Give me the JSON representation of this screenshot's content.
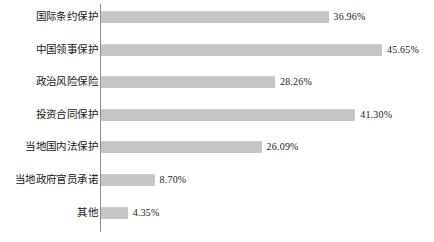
{
  "chart_data": {
    "type": "bar",
    "orientation": "horizontal",
    "title": "",
    "subtitle": "",
    "xlabel": "",
    "ylabel": "",
    "grid": false,
    "legend": null,
    "axis_color": "#8d8d8d",
    "bar_color": "#c6c6c6",
    "xlim": [
      0,
      50
    ],
    "categories": [
      "国际条约保护",
      "中国领事保护",
      "政治风险保险",
      "投资合同保护",
      "当地国内法保护",
      "当地政府官员承诺",
      "其他"
    ],
    "values": [
      36.96,
      45.65,
      28.26,
      41.3,
      26.09,
      8.7,
      4.35
    ],
    "value_labels": [
      "36.96%",
      "45.65%",
      "28.26%",
      "41.30%",
      "26.09%",
      "8.70%",
      "4.35%"
    ]
  },
  "rows": [
    {
      "label": "国际条约保护",
      "value": 36.96,
      "value_label": "36.96%"
    },
    {
      "label": "中国领事保护",
      "value": 45.65,
      "value_label": "45.65%"
    },
    {
      "label": "政治风险保险",
      "value": 28.26,
      "value_label": "28.26%"
    },
    {
      "label": "投资合同保护",
      "value": 41.3,
      "value_label": "41.30%"
    },
    {
      "label": "当地国内法保护",
      "value": 26.09,
      "value_label": "26.09%"
    },
    {
      "label": "当地政府官员承诺",
      "value": 8.7,
      "value_label": "8.70%"
    },
    {
      "label": "其他",
      "value": 4.35,
      "value_label": "4.35%"
    }
  ]
}
